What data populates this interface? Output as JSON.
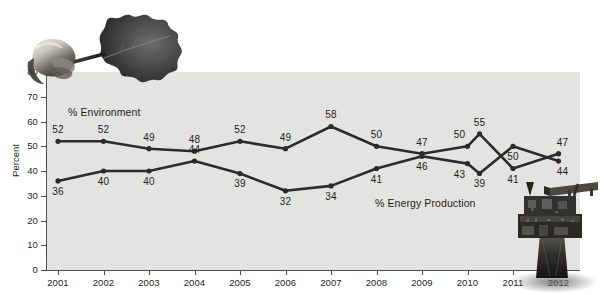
{
  "chart_data": {
    "type": "line",
    "title": "",
    "subtitle": "",
    "xlabel": "",
    "ylabel": "Percent",
    "ylim": [
      0,
      80
    ],
    "ytick_step": 10,
    "yticks": [
      0,
      10,
      20,
      30,
      40,
      50,
      60,
      70,
      80
    ],
    "grid": false,
    "legend_position": "inline-annotation",
    "categories": [
      "2001",
      "2002",
      "2003",
      "2004",
      "2005",
      "2006",
      "2007",
      "2008",
      "2009",
      "2010",
      "2010b",
      "2011",
      "2012"
    ],
    "xtick_labels": [
      "2001",
      "2002",
      "2003",
      "2004",
      "2005",
      "2006",
      "2007",
      "2008",
      "2009",
      "2010",
      "2011",
      "2012"
    ],
    "series": [
      {
        "name": "% Environment",
        "color": "#2b2b2b",
        "values": [
          52,
          52,
          49,
          48,
          52,
          49,
          58,
          50,
          47,
          50,
          55,
          41,
          47
        ]
      },
      {
        "name": "% Energy Production",
        "color": "#2b2b2b",
        "values": [
          36,
          40,
          40,
          44,
          39,
          32,
          34,
          41,
          46,
          43,
          39,
          50,
          44
        ]
      }
    ],
    "annotations": [
      {
        "name": "series-label-environment",
        "text": "% Environment"
      },
      {
        "name": "series-label-energy-production",
        "text": "% Energy Production"
      }
    ],
    "point_labels": {
      "environment": [
        "52",
        "52",
        "49",
        "48",
        "52",
        "49",
        "58",
        "50",
        "47",
        "50",
        "55",
        "41",
        "47"
      ],
      "energy": [
        "36",
        "40",
        "40",
        "44",
        "39",
        "32",
        "34",
        "41",
        "46",
        "43",
        "39",
        "50",
        "44"
      ]
    },
    "colors": {
      "plot_background": "#e3e3e1",
      "line": "#2b2b2b",
      "axis": "#4a4a4a",
      "text": "#231f20",
      "page_background": "#ffffff"
    }
  },
  "decor": {
    "leaf_alt": "hand-holding-oak-leaf-photo",
    "rig_alt": "offshore-oil-drilling-rig-photo"
  }
}
